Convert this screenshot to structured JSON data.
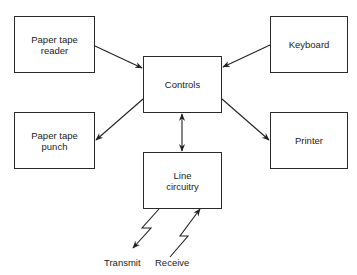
{
  "diagram": {
    "type": "block-diagram",
    "nodes": {
      "paper_tape_reader": "Paper tape\nreader",
      "keyboard": "Keyboard",
      "controls": "Controls",
      "paper_tape_punch": "Paper tape\npunch",
      "printer": "Printer",
      "line_circuitry": "Line\ncircuitry"
    },
    "terminals": {
      "transmit": "Transmit",
      "receive": "Receive"
    },
    "edges": [
      {
        "from": "Paper tape reader",
        "to": "Controls"
      },
      {
        "from": "Keyboard",
        "to": "Controls"
      },
      {
        "from": "Controls",
        "to": "Paper tape punch"
      },
      {
        "from": "Controls",
        "to": "Printer"
      },
      {
        "from": "Controls",
        "to": "Line circuitry",
        "bidirectional": true
      },
      {
        "from": "Line circuitry",
        "to": "Transmit",
        "style": "lightning"
      },
      {
        "from": "Receive",
        "to": "Line circuitry",
        "style": "lightning"
      }
    ]
  }
}
